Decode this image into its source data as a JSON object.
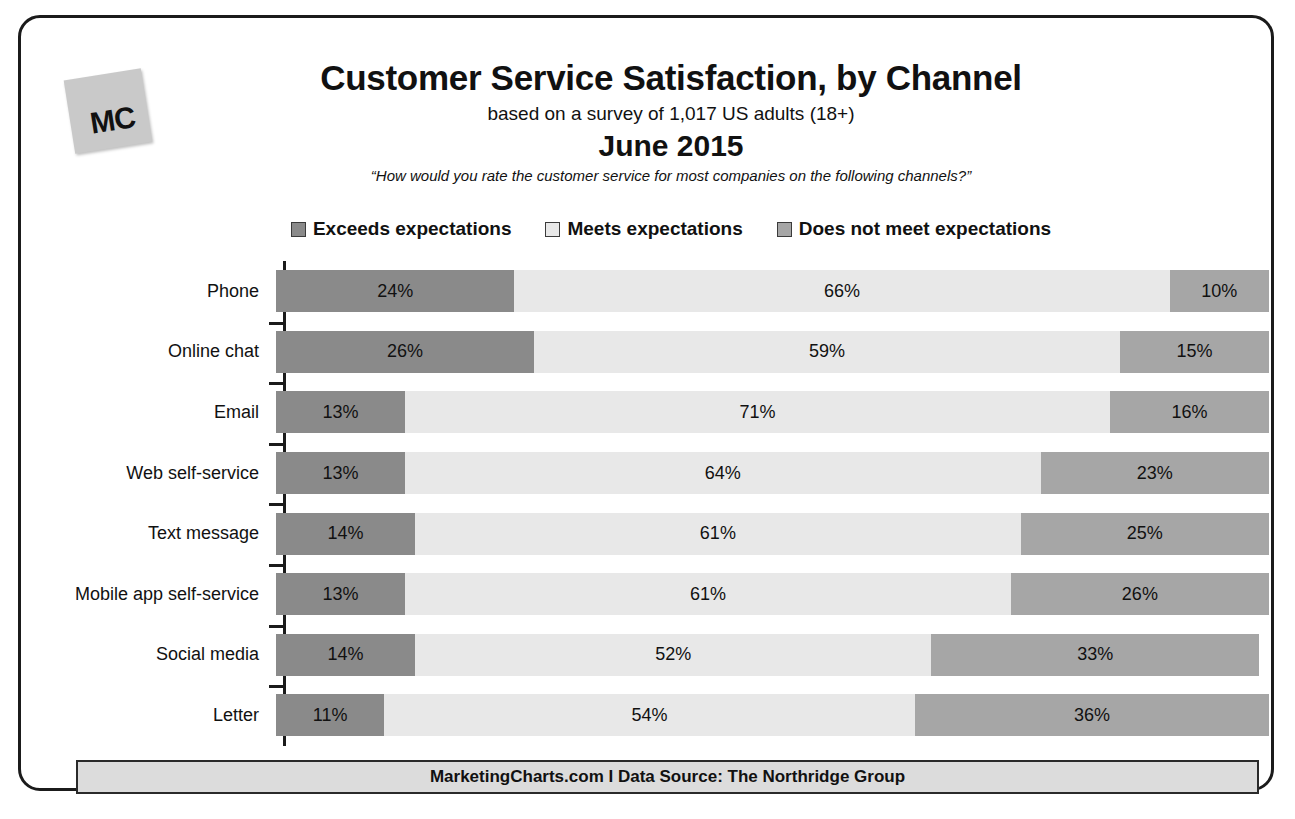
{
  "logo": {
    "text": "MC",
    "name": "marketingcharts-logo"
  },
  "header": {
    "title": "Customer Service Satisfaction, by Channel",
    "subtitle": "based on a survey of 1,017 US adults (18+)",
    "date": "June 2015",
    "question": "“How would you rate the customer service for most companies on the following channels?”"
  },
  "footer": {
    "text": "MarketingCharts.com I Data Source: The Northridge Group"
  },
  "colors": {
    "exceeds": "#8a8a8a",
    "meets": "#e8e8e8",
    "does_not_meet": "#a6a6a6",
    "frame": "#1b1b1b",
    "footer_bg": "#dcdcdc",
    "logo_bg": "#c9c9c9"
  },
  "chart_data": {
    "type": "bar",
    "orientation": "horizontal",
    "stacked": true,
    "title": "Customer Service Satisfaction, by Channel",
    "subtitle": "based on a survey of 1,017 US adults (18+)",
    "date": "June 2015",
    "question": "“How would you rate the customer service for most companies on the following channels?”",
    "xlabel": "",
    "ylabel": "",
    "xlim": [
      0,
      100
    ],
    "grid": false,
    "legend_position": "top",
    "value_suffix": "%",
    "categories": [
      "Phone",
      "Online chat",
      "Email",
      "Web self-service",
      "Text message",
      "Mobile app self-service",
      "Social media",
      "Letter"
    ],
    "series": [
      {
        "name": "Exceeds expectations",
        "color": "#8a8a8a",
        "values": [
          24,
          26,
          13,
          13,
          14,
          13,
          14,
          11
        ]
      },
      {
        "name": "Meets expectations",
        "color": "#e8e8e8",
        "values": [
          66,
          59,
          71,
          64,
          61,
          61,
          52,
          54
        ]
      },
      {
        "name": "Does not meet expectations",
        "color": "#a6a6a6",
        "values": [
          10,
          15,
          16,
          23,
          25,
          26,
          33,
          36
        ]
      }
    ],
    "labels": [
      [
        "24%",
        "66%",
        "10%"
      ],
      [
        "26%",
        "59%",
        "15%"
      ],
      [
        "13%",
        "71%",
        "16%"
      ],
      [
        "13%",
        "64%",
        "23%"
      ],
      [
        "14%",
        "61%",
        "25%"
      ],
      [
        "13%",
        "61%",
        "26%"
      ],
      [
        "14%",
        "52%",
        "33%"
      ],
      [
        "11%",
        "54%",
        "36%"
      ]
    ]
  }
}
